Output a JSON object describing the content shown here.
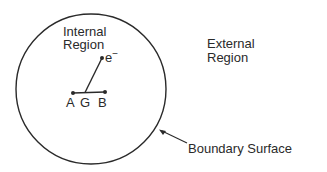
{
  "diagram": {
    "internal_region": {
      "line1": "Internal",
      "line2": "Region"
    },
    "external_region": {
      "line1": "External",
      "line2": "Region"
    },
    "electron": {
      "label": "e",
      "charge": "−"
    },
    "points": {
      "a": "A",
      "g": "G",
      "b": "B"
    },
    "boundary_label": "Boundary Surface",
    "colors": {
      "ink": "#2a2a2a",
      "background": "#ffffff"
    }
  }
}
